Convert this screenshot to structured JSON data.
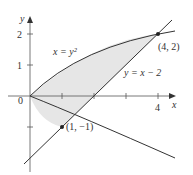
{
  "diagram": {
    "type": "region-between-curves",
    "axes": {
      "x_label": "x",
      "y_label": "y",
      "origin_label": "0",
      "x_ticks": [
        1,
        2,
        3,
        4
      ],
      "x_tick_labels": {
        "4": "4"
      },
      "y_ticks": [
        -1,
        1,
        2
      ],
      "y_tick_labels": {
        "1": "1",
        "2": "2"
      }
    },
    "curves": [
      {
        "name": "parabola",
        "label": "x = y²",
        "equation": "x=y^2"
      },
      {
        "name": "line",
        "label": "y = x − 2",
        "equation": "y=x-2"
      }
    ],
    "points": [
      {
        "label": "(4, 2)",
        "x": 4,
        "y": 2
      },
      {
        "label": "(1, −1)",
        "x": 1,
        "y": -1
      }
    ],
    "shaded_region": "bounded by x = y² and y = x − 2, from y = −1 to y = 2",
    "colors": {
      "curve": "#333333",
      "shade": "#e6e6e6",
      "axis": "#555555"
    }
  }
}
